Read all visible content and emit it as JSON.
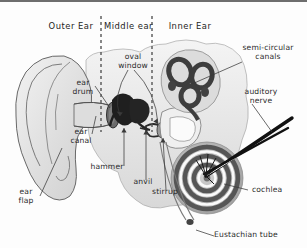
{
  "figure": {
    "kind": "anatomical-diagram",
    "background_color": "#fdfdfd",
    "ink_color": "#2b2b2b",
    "border_color": "#6e6e6e"
  },
  "sections": [
    {
      "id": "outer",
      "label": "Outer Ear"
    },
    {
      "id": "middle",
      "label": "Middle ear"
    },
    {
      "id": "inner",
      "label": "Inner Ear"
    }
  ],
  "dividers": [
    {
      "id": "outer-middle",
      "style": "dashed"
    },
    {
      "id": "middle-inner",
      "style": "dashed"
    }
  ],
  "labels": [
    {
      "id": "ear-drum",
      "text": "ear\ndrum"
    },
    {
      "id": "ear-canal",
      "text": "ear\ncanal"
    },
    {
      "id": "ear-flap",
      "text": "ear\nflap"
    },
    {
      "id": "oval-window",
      "text": "oval\nwindow"
    },
    {
      "id": "hammer",
      "text": "hammer"
    },
    {
      "id": "anvil",
      "text": "anvil"
    },
    {
      "id": "stirrup",
      "text": "stirrup"
    },
    {
      "id": "semi-circular-canals",
      "text": "semi-circular\ncanals"
    },
    {
      "id": "auditory-nerve",
      "text": "auditory\nnerve"
    },
    {
      "id": "cochlea",
      "text": "cochlea"
    },
    {
      "id": "eustachian-tube",
      "text": "Eustachian tube"
    }
  ],
  "palette": {
    "tissue_light": "#e9e9e9",
    "tissue_mid": "#c2c2c2",
    "tissue_dark": "#8f8f8f",
    "bone_dark": "#242424",
    "outline": "#4a4a4a"
  }
}
